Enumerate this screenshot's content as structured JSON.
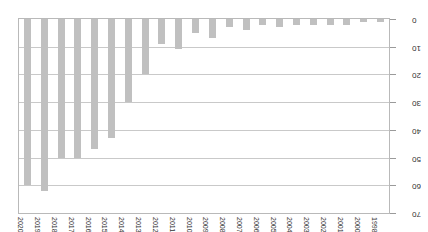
{
  "chart_data": {
    "type": "bar",
    "title": "",
    "subtitle": "",
    "xlabel": "",
    "ylabel": "",
    "ylim": [
      0,
      70
    ],
    "yticks": [
      0,
      10,
      20,
      30,
      40,
      50,
      60,
      70
    ],
    "grid": true,
    "legend": null,
    "orientation": "rotated-180",
    "bar_color": "#c0c0c0",
    "categories": [
      "1998",
      "2000",
      "2001",
      "2002",
      "2003",
      "2004",
      "2005",
      "2006",
      "2007",
      "2008",
      "2009",
      "2010",
      "2011",
      "2012",
      "2013",
      "2014",
      "2015",
      "2016",
      "2017",
      "2018",
      "2019",
      "2020"
    ],
    "values": [
      1,
      1,
      2,
      2,
      2,
      2,
      3,
      2,
      4,
      3,
      7,
      5,
      11,
      9,
      20,
      30,
      43,
      47,
      50,
      50,
      62,
      60
    ],
    "series": [
      {
        "name": "count",
        "values": [
          1,
          1,
          2,
          2,
          2,
          2,
          3,
          2,
          4,
          3,
          7,
          5,
          11,
          9,
          20,
          30,
          43,
          47,
          50,
          50,
          62,
          60
        ]
      }
    ]
  }
}
